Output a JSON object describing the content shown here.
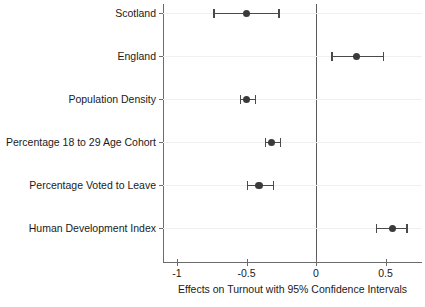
{
  "chart_data": {
    "type": "scatter",
    "title": "",
    "xlabel": "Effects on Turnout with 95% Confidence Intervals",
    "ylabel": "",
    "xlim": [
      -1.12,
      0.74
    ],
    "xticks": [
      -1,
      -0.5,
      0,
      0.5
    ],
    "xticklabels": [
      "-1",
      "-0.5",
      "0",
      "0.5"
    ],
    "grid": true,
    "legend": "none",
    "reference_line": 0,
    "categories": [
      "Scotland",
      "England",
      "Population Density",
      "Percentage 18 to 29 Age Cohort",
      "Percentage Voted to Leave",
      "Human Development Index"
    ],
    "values": [
      -0.5,
      0.29,
      -0.5,
      -0.32,
      -0.41,
      0.55
    ],
    "ci_low": [
      -0.74,
      0.11,
      -0.55,
      -0.37,
      -0.5,
      0.43
    ],
    "ci_high": [
      -0.27,
      0.48,
      -0.44,
      -0.26,
      -0.31,
      0.65
    ],
    "points": [
      {
        "label": "Scotland",
        "estimate": -0.5,
        "ci_low": -0.74,
        "ci_high": -0.27
      },
      {
        "label": "England",
        "estimate": 0.29,
        "ci_low": 0.11,
        "ci_high": 0.48
      },
      {
        "label": "Population Density",
        "estimate": -0.5,
        "ci_low": -0.55,
        "ci_high": -0.44
      },
      {
        "label": "Percentage 18 to 29 Age Cohort",
        "estimate": -0.32,
        "ci_low": -0.37,
        "ci_high": -0.26
      },
      {
        "label": "Percentage Voted to Leave",
        "estimate": -0.41,
        "ci_low": -0.5,
        "ci_high": -0.31
      },
      {
        "label": "Human Development Index",
        "estimate": 0.55,
        "ci_low": 0.43,
        "ci_high": 0.65
      }
    ],
    "colors": {
      "point": "#3a3a3a",
      "interval": "#4a4a4a",
      "axis": "#6b6b6b",
      "grid": "#f0f0f0",
      "zero_line": "#5a5a5a",
      "background": "#ffffff"
    }
  }
}
